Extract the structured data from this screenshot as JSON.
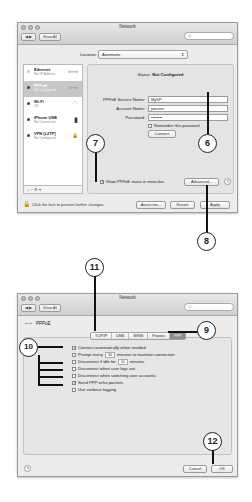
{
  "window1": {
    "title": "Network",
    "toolbar": {
      "back": "◀",
      "forward": "▶",
      "show_all": "Show All",
      "search_placeholder": "Q"
    },
    "location": {
      "label": "Location:",
      "value": "Automatic"
    },
    "services": [
      {
        "name": "Ethernet",
        "status": "Not IP Address",
        "icon": "⟺",
        "dot": "grey",
        "selected": false
      },
      {
        "name": "PPPoE",
        "status": "Not Configured",
        "icon": "⟺",
        "dot": "dark",
        "selected": true
      },
      {
        "name": "Wi-Fi",
        "status": "Off",
        "icon": "◠",
        "dot": "dark",
        "selected": false
      },
      {
        "name": "iPhone USB",
        "status": "Not Connected",
        "icon": "▮",
        "dot": "dark",
        "selected": false
      },
      {
        "name": "VPN (L2TP)",
        "status": "Not Configured",
        "icon": "🔒",
        "dot": "dark",
        "selected": false
      }
    ],
    "sidebar_tools": "+  −  ⚙ ▾",
    "detail": {
      "status_label": "Status:",
      "status_value": "Not Configured",
      "service_name_label": "PPPoE Service Name:",
      "service_name_value": "MySP",
      "account_name_label": "Account Name:",
      "account_name_value": "joeuser",
      "password_label": "Password:",
      "password_value": "••••••••",
      "remember_password": "Remember this password",
      "connect_button": "Connect"
    },
    "show_status_checkbox": "Show PPPoE status in menu bar",
    "advanced_button": "Advanced...",
    "help": "?",
    "lock_text": "Click the lock to prevent further changes.",
    "assist_button": "Assist me...",
    "revert_button": "Revert",
    "apply_button": "Apply"
  },
  "window2": {
    "title": "Network",
    "toolbar": {
      "back": "◀",
      "forward": "▶",
      "show_all": "Show All",
      "search_placeholder": "Q"
    },
    "service_header": "PPPoE",
    "tabs": [
      "TCP/IP",
      "DNS",
      "WINS",
      "Proxies",
      "PPP"
    ],
    "active_tab": "PPP",
    "options": [
      {
        "label": "Connect automatically when needed",
        "checked": true
      },
      {
        "label": "Prompt every",
        "checked": false,
        "value": "30",
        "suffix": "minutes to maintain connection"
      },
      {
        "label": "Disconnect if idle for",
        "checked": false,
        "value": "10",
        "suffix": "minutes"
      },
      {
        "label": "Disconnect when user logs out",
        "checked": false
      },
      {
        "label": "Disconnect when switching user accounts",
        "checked": false
      },
      {
        "label": "Send PPP echo packets",
        "checked": true
      },
      {
        "label": "Use verbose logging",
        "checked": false
      }
    ],
    "help": "?",
    "cancel_button": "Cancel",
    "ok_button": "OK"
  },
  "callouts": {
    "c6": "6",
    "c7": "7",
    "c8": "8",
    "c9": "9",
    "c10": "10",
    "c11": "11",
    "c12": "12"
  }
}
